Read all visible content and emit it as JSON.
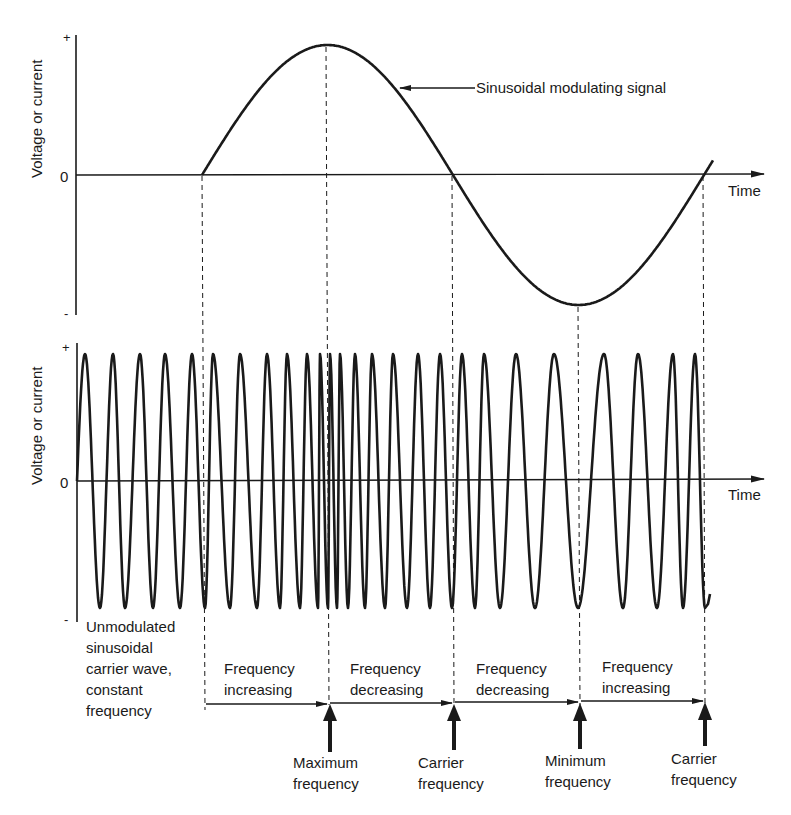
{
  "chart_data": [
    {
      "type": "line",
      "panel": "top",
      "title": "",
      "series": [
        {
          "name": "Sinusoidal modulating signal",
          "shape": "sine",
          "start_x": 202,
          "cycles": 1.04
        }
      ],
      "xlabel": "Time",
      "ylabel": "Voltage or current",
      "y_ticks": [
        "+",
        "0",
        "-"
      ],
      "annotation": "Sinusoidal modulating signal",
      "key_points": [
        {
          "name": "zero-crossing-rising",
          "x_px": 202
        },
        {
          "name": "maximum",
          "x_px": 326
        },
        {
          "name": "zero-crossing-falling",
          "x_px": 453
        },
        {
          "name": "minimum",
          "x_px": 578
        },
        {
          "name": "zero-crossing-rising",
          "x_px": 704
        }
      ]
    },
    {
      "type": "line",
      "panel": "bottom",
      "title": "",
      "series": [
        {
          "name": "Frequency-modulated carrier wave",
          "peaks_x_px": [
            85,
            113,
            140,
            165,
            192,
            213,
            240,
            267,
            287,
            307,
            320,
            330,
            340,
            355,
            372,
            393,
            418,
            440,
            462,
            484,
            516,
            554,
            604,
            638,
            673,
            695
          ],
          "troughs_x_px": [
            100,
            125,
            153,
            180,
            205,
            230,
            257,
            280,
            300,
            318,
            328,
            337,
            348,
            365,
            385,
            407,
            430,
            452,
            475,
            500,
            535,
            578,
            623,
            657,
            683,
            705
          ]
        }
      ],
      "xlabel": "Time",
      "ylabel": "Voltage or current",
      "y_ticks": [
        "+",
        "0",
        "-"
      ]
    }
  ],
  "top_panel": {
    "ylabel": "Voltage or current",
    "tick_plus": "+",
    "tick_zero": "0",
    "tick_minus": "-",
    "xlabel": "Time",
    "annotation": "Sinusoidal modulating signal"
  },
  "bottom_panel": {
    "ylabel": "Voltage or current",
    "tick_plus": "+",
    "tick_zero": "0",
    "tick_minus": "-",
    "xlabel": "Time"
  },
  "unmodulated_note": [
    "Unmodulated",
    "sinusoidal",
    "carrier wave,",
    "constant",
    "frequency"
  ],
  "segments": [
    {
      "line1": "Frequency",
      "line2": "increasing"
    },
    {
      "line1": "Frequency",
      "line2": "decreasing"
    },
    {
      "line1": "Frequency",
      "line2": "decreasing"
    },
    {
      "line1": "Frequency",
      "line2": "increasing"
    }
  ],
  "markers": [
    {
      "line1": "Maximum",
      "line2": "frequency"
    },
    {
      "line1": "Carrier",
      "line2": "frequency"
    },
    {
      "line1": "Minimum",
      "line2": "frequency"
    },
    {
      "line1": "Carrier",
      "line2": "frequency"
    }
  ],
  "colors": {
    "ink": "#1a1a1a",
    "background": "#ffffff"
  }
}
